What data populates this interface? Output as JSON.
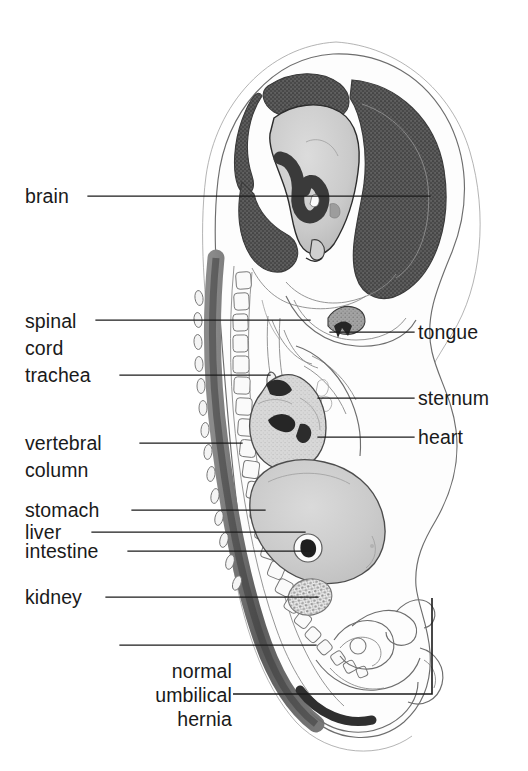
{
  "figure": {
    "background_color": "#ffffff",
    "width": 528,
    "height": 771,
    "ink_color": "#1b1b1b"
  },
  "labels": {
    "brain": "brain",
    "spinal": "spinal",
    "cord": "cord",
    "trachea": "trachea",
    "vertebral": "vertebral",
    "column": "column",
    "stomach": "stomach",
    "liver": "liver",
    "intestine": "intestine",
    "kidney": "kidney",
    "normal": "normal",
    "umbilical": "umbilical",
    "hernia": "hernia",
    "tongue": "tongue",
    "sternum": "sternum",
    "heart": "heart"
  },
  "structures": {
    "brain": "brain",
    "spinal_cord": "spinal cord",
    "trachea": "trachea",
    "vertebral_column": "vertebral column",
    "stomach": "stomach",
    "liver": "liver",
    "intestine": "intestine",
    "kidney": "kidney",
    "umbilical_hernia": "normal umbilical hernia",
    "tongue": "tongue",
    "sternum": "sternum",
    "heart": "heart",
    "body_outline": "body outline",
    "amnion": "amniotic membrane",
    "tail": "tail",
    "limb_bud": "limb bud"
  },
  "colors": {
    "ink": "#1b1b1b",
    "outline": "#6d6d6d",
    "dark_tissue": "#4a4a4a",
    "mid_tissue": "#8e8e8e",
    "light_tissue": "#c9c9c9",
    "pale_tissue": "#e4e4e4",
    "paper": "#ffffff"
  }
}
